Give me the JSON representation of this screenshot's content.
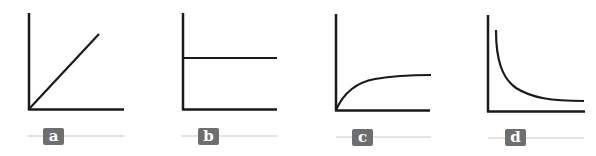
{
  "figure": {
    "panels": [
      {
        "id": "a",
        "label": "a",
        "curve": "linear-increasing"
      },
      {
        "id": "b",
        "label": "b",
        "curve": "constant"
      },
      {
        "id": "c",
        "label": "c",
        "curve": "saturating-increase"
      },
      {
        "id": "d",
        "label": "d",
        "curve": "inverse-decay"
      }
    ],
    "colors": {
      "axis": "#1a1a1a",
      "curve": "#1a1a1a",
      "label_bg": "#6e6e6e",
      "label_text": "#ffffff",
      "rule": "#c8c8c8"
    }
  }
}
